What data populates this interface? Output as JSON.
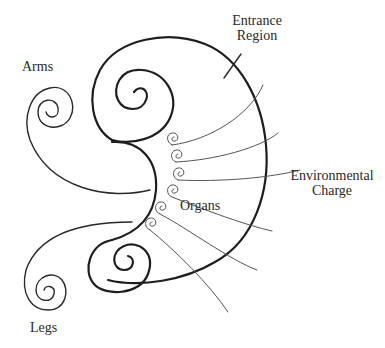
{
  "diagram": {
    "labels": {
      "arms": "Arms",
      "entrance_line1": "Entrance",
      "entrance_line2": "Region",
      "environmental_line1": "Environmental",
      "environmental_line2": "Charge",
      "organs": "Organs",
      "legs": "Legs"
    },
    "colors": {
      "background": "#ffffff",
      "stroke": "#1e1e1e",
      "text": "#2a2a2a"
    }
  }
}
